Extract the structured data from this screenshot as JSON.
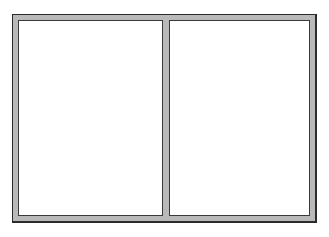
{
  "window": {
    "panes": [
      {
        "id": "left",
        "label": ""
      },
      {
        "id": "right",
        "label": ""
      }
    ]
  },
  "colors": {
    "frame": "#b9b9b9",
    "outline": "#2b2b2b",
    "pane_background": "#ffffff"
  }
}
